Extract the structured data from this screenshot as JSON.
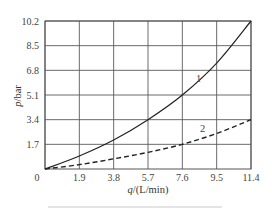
{
  "chart_data": {
    "type": "line",
    "title": "",
    "xlabel": "q/(L/min)",
    "ylabel": "p/bar",
    "x_ticks": [
      "0",
      "1.9",
      "3.8",
      "5.7",
      "7.6",
      "9.5",
      "11.4"
    ],
    "y_ticks": [
      "1.7",
      "3.4",
      "5.1",
      "6.8",
      "8.5",
      "10.2"
    ],
    "xlim": [
      0,
      11.4
    ],
    "ylim": [
      0,
      10.2
    ],
    "grid": true,
    "legend": "inline labels",
    "series": [
      {
        "name": "1",
        "style": "solid",
        "x": [
          0,
          1.9,
          3.8,
          5.7,
          7.6,
          9.5,
          11.4
        ],
        "y": [
          0,
          0.9,
          2.0,
          3.4,
          5.1,
          7.3,
          10.2
        ]
      },
      {
        "name": "2",
        "style": "dashed",
        "x": [
          0,
          1.9,
          3.8,
          5.7,
          7.6,
          9.5,
          11.4
        ],
        "y": [
          0,
          0.3,
          0.7,
          1.15,
          1.7,
          2.45,
          3.4
        ]
      }
    ]
  },
  "labels": {
    "origin": "0",
    "series_1": "1",
    "series_2": "2"
  }
}
